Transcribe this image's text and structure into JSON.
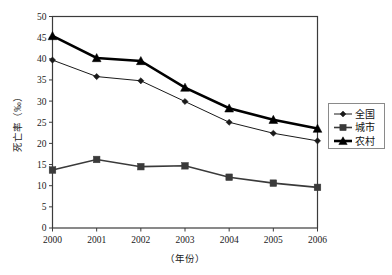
{
  "chart_data": {
    "type": "line",
    "title": "",
    "subtitle": "",
    "xlabel": "（年份）",
    "ylabel": "死亡率（‰）",
    "categories": [
      "2000",
      "2001",
      "2002",
      "2003",
      "2004",
      "2005",
      "2006"
    ],
    "x": [
      2000,
      2001,
      2002,
      2003,
      2004,
      2005,
      2006
    ],
    "xlim": [
      2000,
      2006
    ],
    "ylim": [
      0,
      50
    ],
    "yticks": [
      0,
      5,
      10,
      15,
      20,
      25,
      30,
      35,
      40,
      45,
      50
    ],
    "ytick_labels": [
      "0",
      "5",
      "10",
      "15",
      "20",
      "25",
      "30",
      "35",
      "40",
      "45",
      "50"
    ],
    "xticks": [
      2000,
      2001,
      2002,
      2003,
      2004,
      2005,
      2006
    ],
    "xtick_labels": [
      "2000",
      "2001",
      "2002",
      "2003",
      "2004",
      "2005",
      "2006"
    ],
    "grid": false,
    "legend_position": "right",
    "series": [
      {
        "name": "全国",
        "marker": "diamond",
        "color": "#1a1a1a",
        "line_width": 1.0,
        "values": [
          39.7,
          35.8,
          34.8,
          29.9,
          25.0,
          22.4,
          20.6
        ]
      },
      {
        "name": "城市",
        "marker": "square",
        "color": "#3a3a3a",
        "line_width": 1.6,
        "values": [
          13.7,
          16.2,
          14.5,
          14.7,
          12.0,
          10.6,
          9.6
        ]
      },
      {
        "name": "农村",
        "marker": "triangle",
        "color": "#000000",
        "line_width": 2.6,
        "values": [
          45.4,
          40.2,
          39.5,
          33.2,
          28.3,
          25.6,
          23.5
        ]
      }
    ]
  },
  "axes": {
    "y_title": "死亡率（‰）",
    "x_title": "（年份）"
  },
  "legend": {
    "items": [
      {
        "label": "全国",
        "marker": "diamond"
      },
      {
        "label": "城市",
        "marker": "square"
      },
      {
        "label": "农村",
        "marker": "triangle"
      }
    ]
  },
  "colors": {
    "frame": "#3b3b3b",
    "national": "#1a1a1a",
    "urban": "#3a3a3a",
    "rural": "#000000",
    "background": "#ffffff"
  }
}
